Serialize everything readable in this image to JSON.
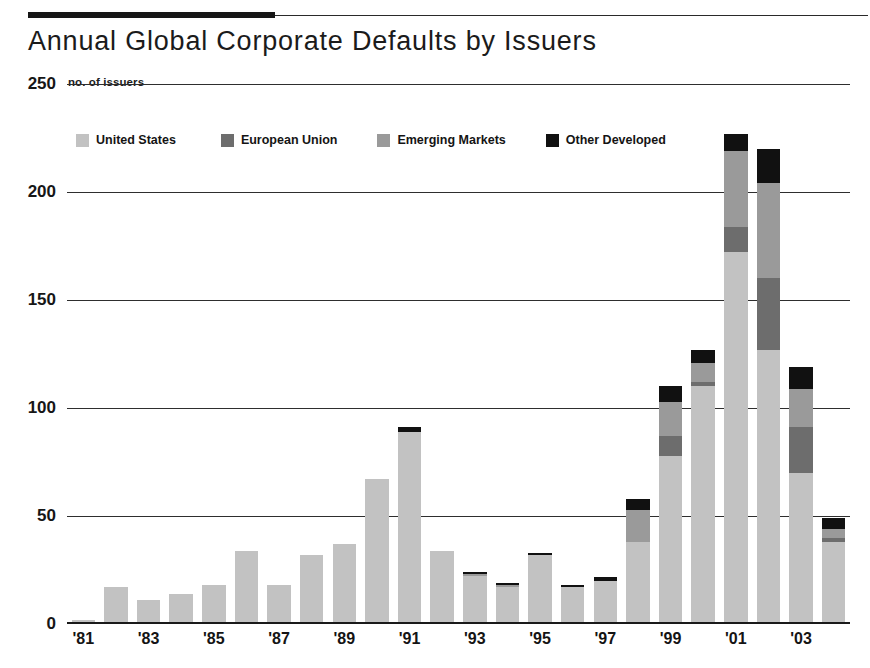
{
  "header": {
    "title": "Annual Global Corporate Defaults by Issuers",
    "units_label": "no. of issuers"
  },
  "legend": {
    "items": [
      {
        "label": "United States",
        "color": "#c2c2c2"
      },
      {
        "label": "European Union",
        "color": "#6d6d6d"
      },
      {
        "label": "Emerging Markets",
        "color": "#9a9a9a"
      },
      {
        "label": "Other Developed",
        "color": "#111111"
      }
    ]
  },
  "axis": {
    "y_ticks": [
      "0",
      "50",
      "100",
      "150",
      "200",
      "250"
    ],
    "x_ticks": [
      "'81",
      "'83",
      "'85",
      "'87",
      "'89",
      "'91",
      "'93",
      "'95",
      "'97",
      "'99",
      "'01",
      "'03"
    ]
  },
  "chart_data": {
    "type": "bar",
    "title": "Annual Global Corporate Defaults by Issuers",
    "subtitle": "no. of issuers",
    "xlabel": "",
    "ylabel": "no. of issuers",
    "ylim": [
      0,
      250
    ],
    "ytick_values": [
      0,
      50,
      100,
      150,
      200,
      250
    ],
    "grid": true,
    "stacked": true,
    "legend_position": "top-left",
    "categories": [
      "1981",
      "1982",
      "1983",
      "1984",
      "1985",
      "1986",
      "1987",
      "1988",
      "1989",
      "1990",
      "1991",
      "1992",
      "1993",
      "1994",
      "1995",
      "1996",
      "1997",
      "1998",
      "1999",
      "2000",
      "2001",
      "2002",
      "2003",
      "2004"
    ],
    "xtick_labels": [
      "'81",
      "",
      "'83",
      "",
      "'85",
      "",
      "'87",
      "",
      "'89",
      "",
      "'91",
      "",
      "'93",
      "",
      "'95",
      "",
      "'97",
      "",
      "'99",
      "",
      "'01",
      "",
      "'03",
      ""
    ],
    "series": [
      {
        "name": "United States",
        "color": "#c2c2c2",
        "values": [
          2,
          17,
          11,
          14,
          18,
          34,
          18,
          32,
          37,
          67,
          89,
          34,
          22,
          17,
          32,
          17,
          20,
          38,
          78,
          110,
          172,
          127,
          70,
          38
        ]
      },
      {
        "name": "European Union",
        "color": "#6d6d6d",
        "values": [
          0,
          0,
          0,
          0,
          0,
          0,
          0,
          0,
          0,
          0,
          0,
          0,
          0,
          0,
          0,
          0,
          0,
          0,
          9,
          2,
          12,
          33,
          21,
          2
        ]
      },
      {
        "name": "Emerging Markets",
        "color": "#9a9a9a",
        "values": [
          0,
          0,
          0,
          0,
          0,
          0,
          0,
          0,
          0,
          0,
          0,
          0,
          1,
          1,
          0,
          0,
          0,
          15,
          16,
          9,
          35,
          44,
          18,
          4
        ]
      },
      {
        "name": "Other Developed",
        "color": "#111111",
        "values": [
          0,
          0,
          0,
          0,
          0,
          0,
          0,
          0,
          0,
          0,
          2,
          0,
          1,
          1,
          1,
          1,
          2,
          5,
          7,
          6,
          8,
          16,
          10,
          5
        ]
      }
    ],
    "totals": [
      2,
      17,
      11,
      14,
      18,
      34,
      18,
      32,
      37,
      67,
      91,
      34,
      24,
      19,
      33,
      18,
      22,
      58,
      110,
      127,
      227,
      220,
      119,
      49
    ]
  }
}
